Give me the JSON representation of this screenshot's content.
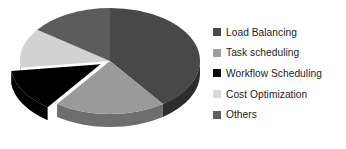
{
  "chart_data": {
    "type": "pie",
    "title": "",
    "subtitle": "",
    "xlabel": "",
    "ylabel": "",
    "grid": false,
    "three_d": true,
    "exploded_slices": [
      "Workflow Scheduling"
    ],
    "legend_position": "right",
    "categories": [
      "Load Balancing",
      "Task scheduling",
      "Workflow Scheduling",
      "Cost Optimization",
      "Others"
    ],
    "values": [
      40,
      20,
      13,
      12,
      15
    ],
    "units": "percent",
    "colors": [
      "#484848",
      "#9a9a9a",
      "#000000",
      "#d2d2d2",
      "#5c5c5c"
    ],
    "slices": [
      {
        "label": "Load Balancing",
        "value": 40,
        "color": "#484848",
        "side_color": "#2d2d2d",
        "exploded": false
      },
      {
        "label": "Task scheduling",
        "value": 20,
        "color": "#9a9a9a",
        "side_color": "#6e6e6e",
        "exploded": false
      },
      {
        "label": "Workflow Scheduling",
        "value": 13,
        "color": "#000000",
        "side_color": "#000000",
        "exploded": true
      },
      {
        "label": "Cost Optimization",
        "value": 12,
        "color": "#d2d2d2",
        "side_color": "#a0a0a0",
        "exploded": false
      },
      {
        "label": "Others",
        "value": 15,
        "color": "#5c5c5c",
        "side_color": "#3a3a3a",
        "exploded": false
      }
    ]
  },
  "legend": {
    "items": [
      {
        "label": "Load Balancing",
        "color": "#4a4a4a"
      },
      {
        "label": "Task scheduling",
        "color": "#9e9e9e"
      },
      {
        "label": "Workflow Scheduling",
        "color": "#0a0a0a"
      },
      {
        "label": "Cost Optimization",
        "color": "#dadada"
      },
      {
        "label": "Others",
        "color": "#5e5e5e"
      }
    ]
  }
}
